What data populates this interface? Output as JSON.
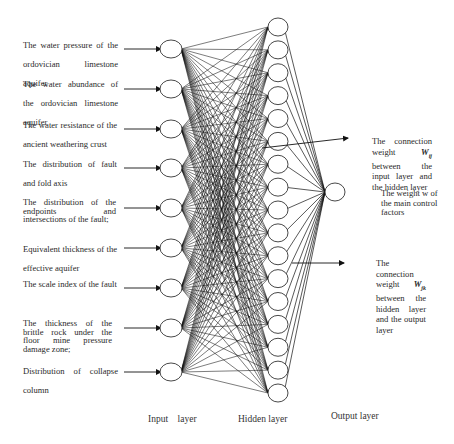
{
  "diagram": {
    "type": "neural-network",
    "layers": {
      "input": {
        "label": "Input    layer",
        "node_count": 9
      },
      "hidden": {
        "label": "Hidden layer",
        "node_count": 17
      },
      "output": {
        "label": "Output layer",
        "node_count": 1
      }
    },
    "input_labels": [
      "The water pressure of the ordovician limestone aquifer",
      "The water abundance of the ordovician limestone aquifer",
      "The water resistance of the ancient weathering crust",
      "The distribution of fault and fold axis",
      "The distribution of the endpoints and intersections of the fault;",
      "Equivalent thickness of the effective aquifer",
      "The scale index of the fault",
      "The thickness of the brittle rock under the floor mine pressure damage zone;",
      "Distribution of collapse column"
    ],
    "annotations": {
      "input_hidden_weight": {
        "text": "The connection weight",
        "symbol": "W",
        "subscript": "ij",
        "rest": "between the input layer and the hidden layer"
      },
      "main_control_weight": {
        "text": "The weight w of the main control factors"
      },
      "hidden_output_weight": {
        "text": "The connection weight",
        "symbol": "W",
        "subscript": "jk",
        "rest": "between the hidden layer and the output layer"
      }
    },
    "colors": {
      "line": "#111111",
      "node_stroke": "#333333",
      "text": "#2a2a2a",
      "background": "#ffffff"
    }
  }
}
